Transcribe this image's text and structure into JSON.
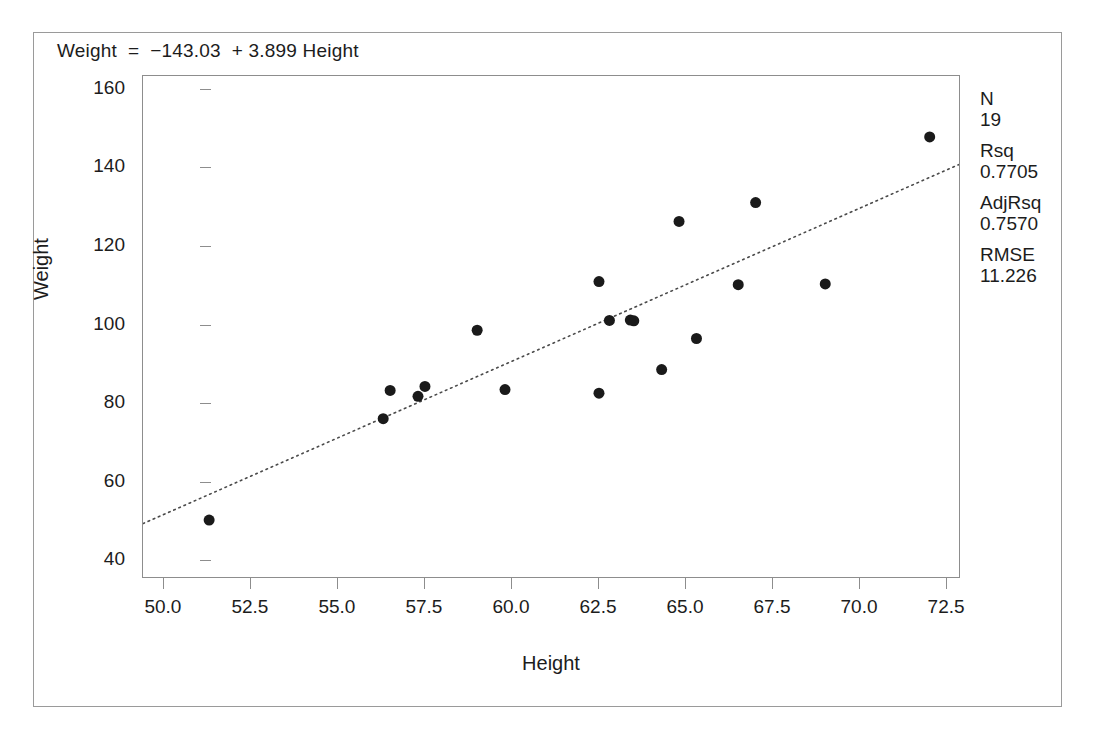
{
  "figure": {
    "equation_label": "Weight  =  −143.03  + 3.899 Height",
    "x_axis_title": "Height",
    "y_axis_title": "Weight"
  },
  "stats": [
    {
      "name": "N",
      "value": "19"
    },
    {
      "name": "Rsq",
      "value": "0.7705"
    },
    {
      "name": "AdjRsq",
      "value": "0.7570"
    },
    {
      "name": "RMSE",
      "value": "11.226"
    }
  ],
  "axes": {
    "x_ticks": [
      "50.0",
      "52.5",
      "55.0",
      "57.5",
      "60.0",
      "62.5",
      "65.0",
      "67.5",
      "70.0",
      "72.5"
    ],
    "y_ticks": [
      "160",
      "140",
      "120",
      "100",
      "80",
      "60",
      "40"
    ]
  },
  "chart_data": {
    "type": "scatter",
    "title": "Weight  =  −143.03  + 3.899 Height",
    "xlabel": "Height",
    "ylabel": "Weight",
    "xlim": [
      49.4,
      72.9
    ],
    "ylim": [
      35.5,
      163.5
    ],
    "xticks": [
      50.0,
      52.5,
      55.0,
      57.5,
      60.0,
      62.5,
      65.0,
      67.5,
      70.0,
      72.5
    ],
    "yticks": [
      40,
      60,
      80,
      100,
      120,
      140,
      160
    ],
    "grid": false,
    "legend": false,
    "marker": {
      "shape": "circle",
      "color": "#1a1a1a",
      "size": 11
    },
    "points": [
      {
        "x": 51.3,
        "y": 50.5
      },
      {
        "x": 56.3,
        "y": 76.3
      },
      {
        "x": 56.5,
        "y": 83.5
      },
      {
        "x": 57.3,
        "y": 82.0
      },
      {
        "x": 57.5,
        "y": 84.5
      },
      {
        "x": 59.0,
        "y": 98.8
      },
      {
        "x": 59.8,
        "y": 83.7
      },
      {
        "x": 62.5,
        "y": 111.2
      },
      {
        "x": 62.5,
        "y": 82.8
      },
      {
        "x": 62.8,
        "y": 101.3
      },
      {
        "x": 63.5,
        "y": 101.2
      },
      {
        "x": 64.3,
        "y": 88.8
      },
      {
        "x": 64.8,
        "y": 126.5
      },
      {
        "x": 65.3,
        "y": 96.7
      },
      {
        "x": 66.5,
        "y": 110.4
      },
      {
        "x": 67.0,
        "y": 131.3
      },
      {
        "x": 69.0,
        "y": 110.6
      },
      {
        "x": 72.0,
        "y": 148.0
      },
      {
        "x": 63.4,
        "y": 101.4
      }
    ],
    "fit_line": {
      "style": "dotted",
      "color": "#4a4a4a",
      "intercept": -143.03,
      "slope": 3.899,
      "x_start": 49.4,
      "y_start": 49.6,
      "x_end": 72.9,
      "y_end": 141.2
    },
    "statistics": {
      "N": 19,
      "Rsq": 0.7705,
      "AdjRsq": 0.757,
      "RMSE": 11.226
    }
  }
}
